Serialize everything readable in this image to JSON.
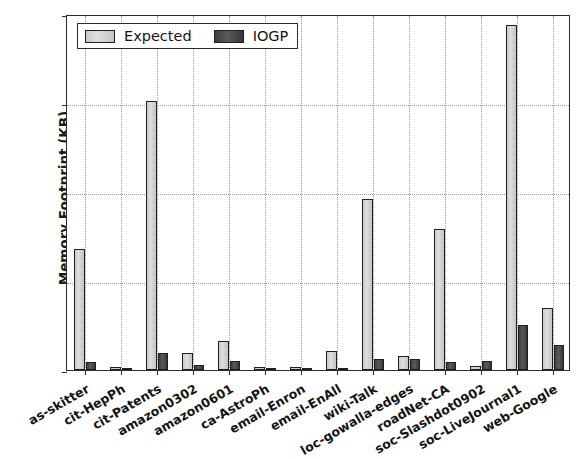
{
  "chart_data": {
    "type": "bar",
    "title": "",
    "xlabel": "",
    "ylabel": "Memory Footprint (KB)",
    "ylim": [
      0,
      20000
    ],
    "yticks": [
      0,
      5000,
      10000,
      15000,
      20000
    ],
    "ytick_labels": [
      "0",
      "5000",
      "10000",
      "15000",
      "20000"
    ],
    "grid": true,
    "legend_position": "upper left",
    "categories": [
      "as-skitter",
      "cit-HepPh",
      "cit-Patents",
      "amazon0302",
      "amazon0601",
      "ca-AstroPh",
      "email-Enron",
      "email-EnAll",
      "wiki-Talk",
      "loc-gowalla-edges",
      "roadNet-CA",
      "soc-Slashdot0902",
      "soc-LiveJournal1",
      "web-Google"
    ],
    "series": [
      {
        "name": "Expected",
        "color": "#d2d2d2",
        "values": [
          6800,
          190,
          15100,
          950,
          1650,
          180,
          170,
          1050,
          9600,
          760,
          7900,
          230,
          19400,
          3500
        ]
      },
      {
        "name": "IOGP",
        "color": "#4b4b4b",
        "values": [
          450,
          80,
          980,
          300,
          520,
          90,
          80,
          130,
          640,
          620,
          430,
          480,
          2530,
          1380
        ]
      }
    ]
  },
  "legend": {
    "items": [
      {
        "label": "Expected",
        "swatch": "expected"
      },
      {
        "label": "IOGP",
        "swatch": "iogp"
      }
    ]
  }
}
